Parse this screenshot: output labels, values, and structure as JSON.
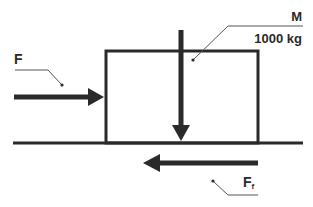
{
  "diagram": {
    "type": "free-body-diagram",
    "block": {
      "label": "M",
      "mass": "1000 kg"
    },
    "forces": [
      {
        "id": "applied",
        "label": "F",
        "direction": "right"
      },
      {
        "id": "weight",
        "label": "",
        "direction": "down"
      },
      {
        "id": "friction",
        "label": "F",
        "subscript": "f",
        "direction": "left"
      }
    ],
    "labels": {
      "mass_symbol": "M",
      "mass_value": "1000 kg",
      "applied_force": "F",
      "friction_force": "F",
      "friction_subscript": "f"
    },
    "colors": {
      "stroke": "#2a2a2a",
      "leader": "#555555",
      "background": "#ffffff"
    }
  }
}
